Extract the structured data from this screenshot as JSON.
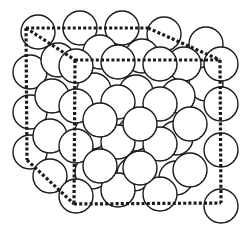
{
  "figure": {
    "title": "",
    "colors": {
      "background": "#ffffff",
      "outline": "#1a1a1a",
      "sphere_fill": "#ffffff",
      "shade": "#555555"
    },
    "sphere_radius": 17,
    "layers": [
      {
        "name": "back",
        "spheres": [
          [
            38,
            32
          ],
          [
            80,
            28
          ],
          [
            122,
            28
          ],
          [
            164,
            34
          ],
          [
            206,
            44
          ],
          [
            30,
            72
          ],
          [
            30,
            112
          ],
          [
            30,
            152
          ],
          [
            206,
            84
          ]
        ]
      },
      {
        "name": "middle",
        "spheres": [
          [
            58,
            60
          ],
          [
            100,
            52
          ],
          [
            142,
            56
          ],
          [
            184,
            64
          ],
          [
            52,
            96
          ],
          [
            94,
            90
          ],
          [
            136,
            92
          ],
          [
            178,
            96
          ],
          [
            50,
            136
          ],
          [
            92,
            132
          ],
          [
            134,
            134
          ],
          [
            176,
            138
          ],
          [
            50,
            176
          ],
          [
            92,
            172
          ],
          [
            134,
            174
          ],
          [
            176,
            178
          ]
        ]
      },
      {
        "name": "front",
        "spheres": [
          [
            76,
            66
          ],
          [
            118,
            62
          ],
          [
            160,
            64
          ],
          [
            221,
            64
          ],
          [
            76,
            106
          ],
          [
            118,
            102
          ],
          [
            160,
            104
          ],
          [
            221,
            104
          ],
          [
            76,
            146
          ],
          [
            118,
            142
          ],
          [
            160,
            144
          ],
          [
            221,
            150
          ],
          [
            76,
            196
          ],
          [
            118,
            190
          ],
          [
            160,
            194
          ],
          [
            221,
            206
          ],
          [
            100,
            120
          ],
          [
            140,
            124
          ],
          [
            100,
            166
          ],
          [
            140,
            168
          ],
          [
            190,
            124
          ],
          [
            190,
            170
          ]
        ]
      }
    ],
    "cube": {
      "back_top_left": [
        26,
        28
      ],
      "back_top_right": [
        148,
        28
      ],
      "back_bottom_left": [
        27,
        160
      ],
      "front_top_left": [
        75,
        60
      ],
      "front_top_right": [
        220,
        60
      ],
      "front_bottom_left": [
        74,
        204
      ],
      "front_bottom_right": [
        221,
        203
      ]
    }
  }
}
